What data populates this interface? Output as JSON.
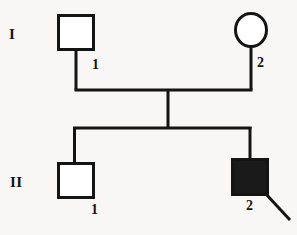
{
  "figure": {
    "type": "pedigree-chart",
    "width": 297,
    "height": 235,
    "background_color": "#f8f7f5",
    "line_color": "#141414",
    "affected_fill_color": "#1a1a1a",
    "unaffected_fill_color": "#ffffff",
    "stroke_width": 3
  },
  "generations": [
    {
      "numeral": "I",
      "individuals": [
        {
          "id": "I-1",
          "number": "1",
          "shape": "square",
          "sex": "male",
          "affected": false
        },
        {
          "id": "I-2",
          "number": "2",
          "shape": "circle",
          "sex": "female",
          "affected": false
        }
      ]
    },
    {
      "numeral": "II",
      "individuals": [
        {
          "id": "II-1",
          "number": "1",
          "shape": "square",
          "sex": "male",
          "affected": false
        },
        {
          "id": "II-2",
          "number": "2",
          "shape": "square",
          "sex": "male",
          "affected": true,
          "proband": true
        }
      ]
    }
  ],
  "connectors": {
    "mating_line": "horizontal line joining I-1 and I-2",
    "descent_line": "vertical line from mating line to sibship line",
    "sibship_line": "horizontal line joining II-1 and II-2"
  },
  "proband_arrow": {
    "points_to": "II-2",
    "direction": "up-left"
  }
}
